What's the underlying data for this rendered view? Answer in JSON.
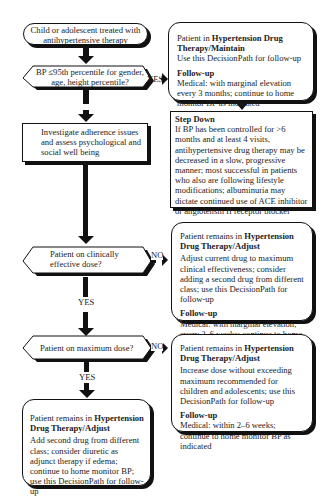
{
  "start": {
    "text": "Child or adolescent treated with antihypertensive therapy"
  },
  "decision_bp": {
    "text": "BP ≤95th percentile for gender, age, height percentile?",
    "yes_label": "YES"
  },
  "maintain_box": {
    "intro": "Patient in ",
    "title": "Hypertension Drug Therapy/Maintain",
    "body": "Use this DecisionPath for follow-up",
    "followup_title": "Follow-up",
    "followup_body": "Medical: with marginal elevation every 3 months; continue to home monitor BP as indicated"
  },
  "step_down": {
    "title": "Step Down",
    "body": "If BP has been controlled for >6 months and at least 4 visits, antihypertensive drug therapy may be decreased in a slow, progressive manner; most successful in patients who also are following lifestyle modifications; albuminuria may dictate continued use of ACE inhibitor or angiotensin II receptor blocker"
  },
  "investigate": {
    "text": "Investigate adherence issues and assess psychological and social well being"
  },
  "decision_effective": {
    "text": "Patient on clinically effective dose?",
    "no_label": "NO",
    "yes_label": "YES"
  },
  "adjust_box_1": {
    "intro": "Patient remains in ",
    "title": "Hypertension Drug Therapy/Adjust",
    "body": "Adjust current drug to maximum clinical effectiveness; consider adding a second drug from different class; use this DecisionPath for follow-up",
    "followup_title": "Follow-up",
    "followup_body": "Medical: with marginal elevation, every 2–6 weeks; continue to home monitor as indicated"
  },
  "decision_max": {
    "text": "Patient on maximum dose?",
    "no_label": "NO",
    "yes_label": "YES"
  },
  "adjust_box_2": {
    "intro": "Patient remains in ",
    "title": "Hypertension Drug Therapy/Adjust",
    "body": "Increase dose without exceeding maximum recommended for children and adolescents; use this DecisionPath for follow-up",
    "followup_title": "Follow-up",
    "followup_body": "Medical: within 2–6 weeks; continue to home monitor BP as indicated"
  },
  "adjust_box_3": {
    "intro": "Patient remains in ",
    "title": "Hypertension Drug Therapy/Adjust",
    "body": "Add second drug from different class; consider diuretic as adjunct therapy if edema; continue to home monitor BP; use this DecisionPath for follow-up"
  }
}
